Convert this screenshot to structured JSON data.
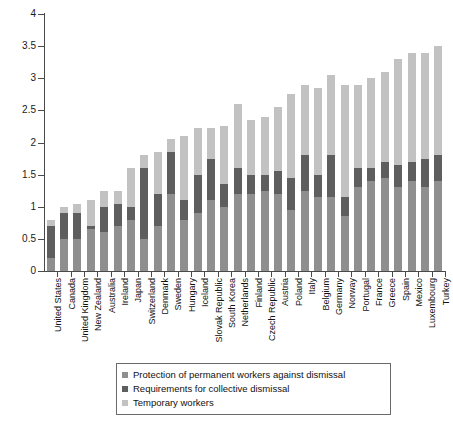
{
  "chart_data": {
    "type": "bar",
    "subtype": "stacked-vertical",
    "title": "",
    "xlabel": "",
    "ylabel": "",
    "ylim": [
      0,
      4
    ],
    "yticks": [
      "0",
      "0.5",
      "1",
      "1.5",
      "2",
      "2.5",
      "3",
      "3.5",
      "4"
    ],
    "ytick_values": [
      0,
      0.5,
      1,
      1.5,
      2,
      2.5,
      3,
      3.5,
      4
    ],
    "grid": false,
    "legend_position": "bottom",
    "categories": [
      "United States",
      "Canada",
      "United Kingdom",
      "New Zealand",
      "Australia",
      "Ireland",
      "Japan",
      "Switzerland",
      "Denmark",
      "Sweden",
      "Hungary",
      "Iceland",
      "Slovak Republic",
      "South Korea",
      "Netherlands",
      "Finland",
      "Czech Republic",
      "Austria",
      "Poland",
      "Italy",
      "Belgium",
      "Germany",
      "Norway",
      "Portugal",
      "France",
      "Greece",
      "Spain",
      "Mexico",
      "Luxembourg",
      "Turkey"
    ],
    "series": [
      {
        "name": "Protection of permanent workers against dismissal",
        "color": "#8f8f8f",
        "values": [
          0.2,
          0.5,
          0.5,
          0.65,
          0.6,
          0.7,
          0.8,
          0.5,
          0.7,
          1.2,
          0.8,
          0.9,
          1.1,
          1.0,
          1.2,
          1.2,
          1.25,
          1.2,
          0.95,
          1.25,
          1.15,
          1.15,
          0.85,
          1.3,
          1.4,
          1.45,
          1.3,
          1.4,
          1.3,
          1.4
        ]
      },
      {
        "name": "Requirements for collective dismissal",
        "color": "#5e5e5e",
        "values": [
          0.5,
          0.4,
          0.4,
          0.05,
          0.4,
          0.35,
          0.2,
          1.1,
          0.5,
          0.65,
          0.3,
          0.6,
          0.65,
          0.35,
          0.4,
          0.3,
          0.25,
          0.35,
          0.5,
          0.55,
          0.35,
          0.65,
          0.3,
          0.3,
          0.2,
          0.25,
          0.35,
          0.3,
          0.45,
          0.4
        ]
      },
      {
        "name": "Temporary workers",
        "color": "#c2c2c2",
        "values": [
          0.09,
          0.09,
          0.14,
          0.4,
          0.25,
          0.2,
          0.6,
          0.2,
          0.65,
          0.2,
          1.0,
          0.72,
          0.47,
          0.9,
          1.0,
          0.85,
          0.9,
          1.0,
          1.3,
          1.1,
          1.35,
          1.25,
          1.75,
          1.3,
          1.4,
          1.4,
          1.65,
          1.7,
          1.65,
          1.7
        ]
      }
    ],
    "totals": [
      0.79,
      0.99,
      1.04,
      1.1,
      1.25,
      1.25,
      1.6,
      1.8,
      1.85,
      2.05,
      2.1,
      2.22,
      2.22,
      2.25,
      2.6,
      2.35,
      2.4,
      2.55,
      2.75,
      2.9,
      2.85,
      3.05,
      2.9,
      2.9,
      3.0,
      3.1,
      3.3,
      3.4,
      3.4,
      3.5
    ]
  },
  "legend": {
    "items": [
      {
        "label": "Protection of permanent workers against dismissal",
        "color": "#8f8f8f"
      },
      {
        "label": "Requirements for collective dismissal",
        "color": "#5e5e5e"
      },
      {
        "label": "Temporary workers",
        "color": "#c2c2c2"
      }
    ]
  }
}
